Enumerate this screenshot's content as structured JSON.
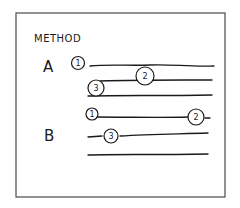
{
  "diagram": {
    "title": "METHOD",
    "methods": [
      {
        "label": "A",
        "markers": [
          "1",
          "2",
          "3"
        ]
      },
      {
        "label": "B",
        "markers": [
          "1",
          "2",
          "3"
        ]
      }
    ]
  }
}
